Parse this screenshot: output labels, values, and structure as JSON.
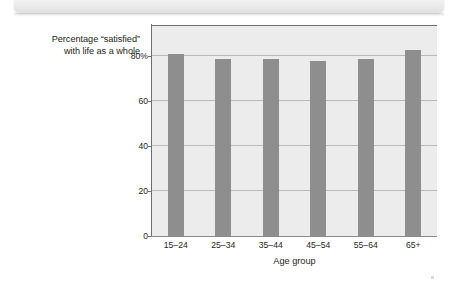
{
  "banner": {
    "label": ""
  },
  "chart_data": {
    "type": "bar",
    "title": "",
    "categories": [
      "15–24",
      "25–34",
      "35–44",
      "45–54",
      "55–64",
      "65+"
    ],
    "values": [
      81,
      79,
      79,
      78,
      79,
      83
    ],
    "xlabel": "Age group",
    "ylabel": "Percentage “satisfied” with life as a whole",
    "ylabel_lines": [
      "Percentage “satisfied”",
      "with life as a whole"
    ],
    "ytick_labels": [
      "0",
      "20",
      "40",
      "60",
      "80%"
    ],
    "ytick_values": [
      0,
      20,
      40,
      60,
      80
    ],
    "ylim": [
      0,
      94
    ],
    "grid": true,
    "legend": false,
    "bar_color": "#8e8e8e",
    "plot_background": "#ececec",
    "gridline_color": "#b9b9b9",
    "axis_color": "#6e6e6e"
  }
}
